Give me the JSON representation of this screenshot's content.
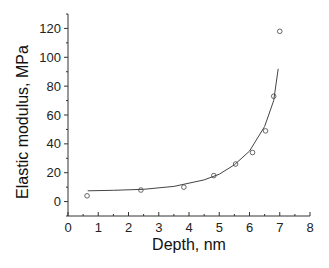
{
  "chart_data": {
    "type": "scatter",
    "title": "",
    "xlabel": "Depth, nm",
    "ylabel": "Elastic modulus, MPa",
    "xlim": [
      0,
      8
    ],
    "ylim": [
      -10,
      130
    ],
    "xticks": [
      "0",
      "1",
      "2",
      "3",
      "4",
      "5",
      "6",
      "7",
      "8"
    ],
    "yticks": [
      "0",
      "20",
      "40",
      "60",
      "80",
      "100",
      "120"
    ],
    "grid": false,
    "legend": null,
    "series": [
      {
        "name": "measured",
        "marker": "open-circle",
        "x": [
          0.63,
          2.41,
          3.83,
          4.82,
          5.54,
          6.1,
          6.53,
          6.8,
          7.0
        ],
        "y": [
          4,
          8,
          10,
          18,
          26,
          34,
          49,
          73,
          118
        ]
      },
      {
        "name": "fit",
        "style": "line",
        "x": [
          0.65,
          1.5,
          2.5,
          3.5,
          4.5,
          5.0,
          5.5,
          6.0,
          6.5,
          6.8,
          6.95
        ],
        "y": [
          7.5,
          7.8,
          8.5,
          10.5,
          15,
          19,
          25.5,
          35,
          52,
          70,
          92
        ]
      }
    ]
  }
}
